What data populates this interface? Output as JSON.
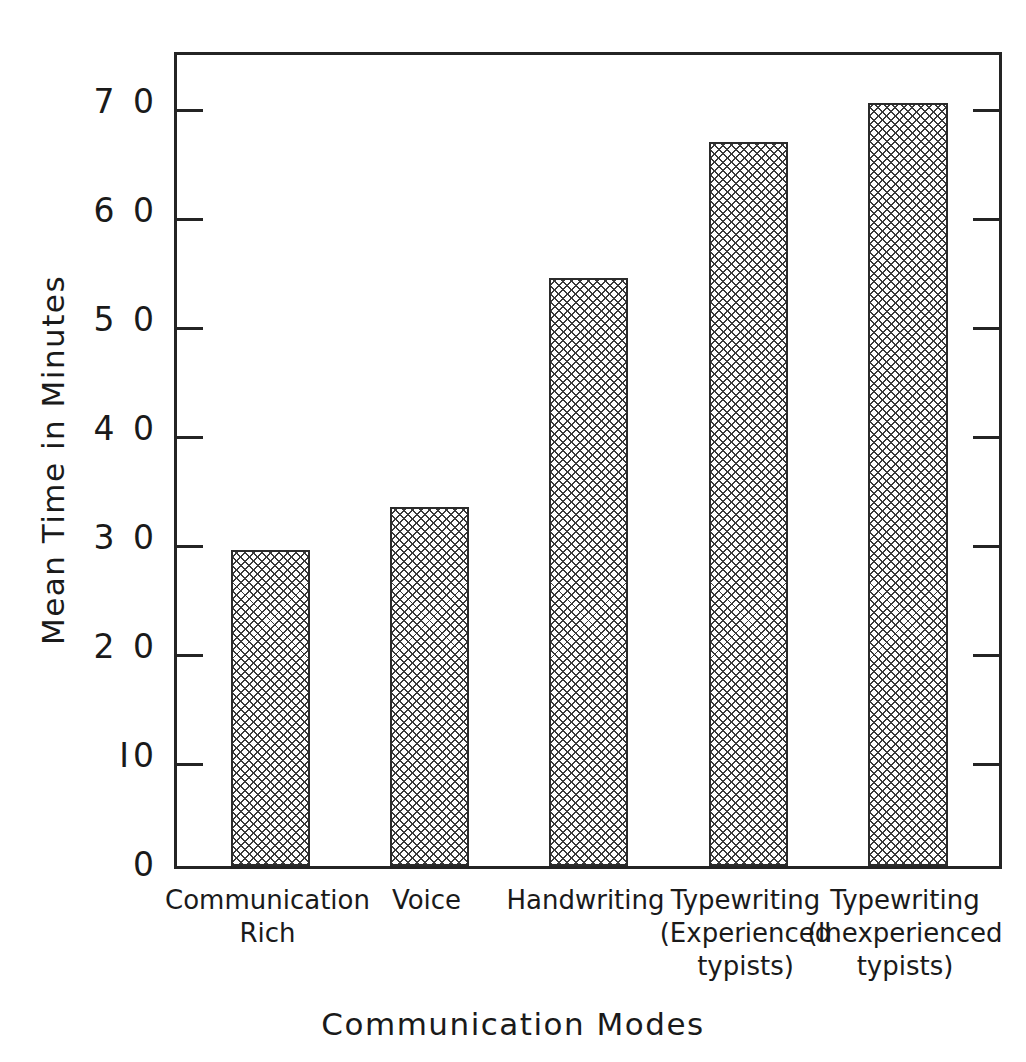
{
  "chart_data": {
    "type": "bar",
    "title": "",
    "xlabel": "Communication Modes",
    "ylabel": "Mean Time in Minutes",
    "categories": [
      "Communication\nRich",
      "Voice",
      "Handwriting",
      "Typewriting\n(Experienced\ntypists)",
      "Typewriting\n(Inexperienced\ntypists)"
    ],
    "category_lines": [
      [
        "Communication",
        "Rich"
      ],
      [
        "Voice"
      ],
      [
        "Handwriting"
      ],
      [
        "Typewriting",
        "(Experienced",
        "typists)"
      ],
      [
        "Typewriting",
        "(Inexperienced",
        "typists)"
      ]
    ],
    "values": [
      29,
      33,
      54,
      66.5,
      70
    ],
    "ylim": [
      0,
      75
    ],
    "yticks": [
      0,
      10,
      20,
      30,
      40,
      50,
      60,
      70
    ],
    "ytick_labels": [
      "0",
      "I0",
      "2 0",
      "3 0",
      "4 0",
      "5 0",
      "6 0",
      "7 0"
    ],
    "grid": false,
    "legend": null,
    "bar_fill": "cross-hatch",
    "bar_color": "#3a3a3a",
    "frame_color": "#242424",
    "background": "#ffffff"
  },
  "axes": {
    "y_axis_title": "Mean Time in Minutes",
    "x_axis_title": "Communication Modes"
  }
}
